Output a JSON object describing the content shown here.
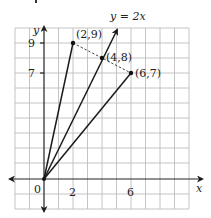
{
  "diagram": {
    "type": "coordinate-plane-vectors",
    "x_range": [
      -2,
      10
    ],
    "y_range": [
      -2,
      10
    ],
    "axis_labels": {
      "x": "x",
      "y": "y"
    },
    "x_ticks": [
      {
        "value": 0,
        "label": "0"
      },
      {
        "value": 2,
        "label": "2"
      },
      {
        "value": 6,
        "label": "6"
      }
    ],
    "y_ticks": [
      {
        "value": 9,
        "label": "9"
      },
      {
        "value": 7,
        "label": "7"
      }
    ],
    "line_label": "y = 2x",
    "points": [
      {
        "x": 2,
        "y": 9,
        "label": "(2,9)"
      },
      {
        "x": 4,
        "y": 8,
        "label": "(4,8)"
      },
      {
        "x": 6,
        "y": 7,
        "label": "(6,7)"
      }
    ],
    "segments_from_origin": [
      "(2,9)",
      "(4,8)",
      "(6,7)"
    ],
    "dashed_segment": [
      "(2,9)",
      "(6,7)"
    ],
    "colors": {
      "grid": "#b8b8b8",
      "axis": "#222222",
      "line": "#1a1a1a"
    }
  }
}
